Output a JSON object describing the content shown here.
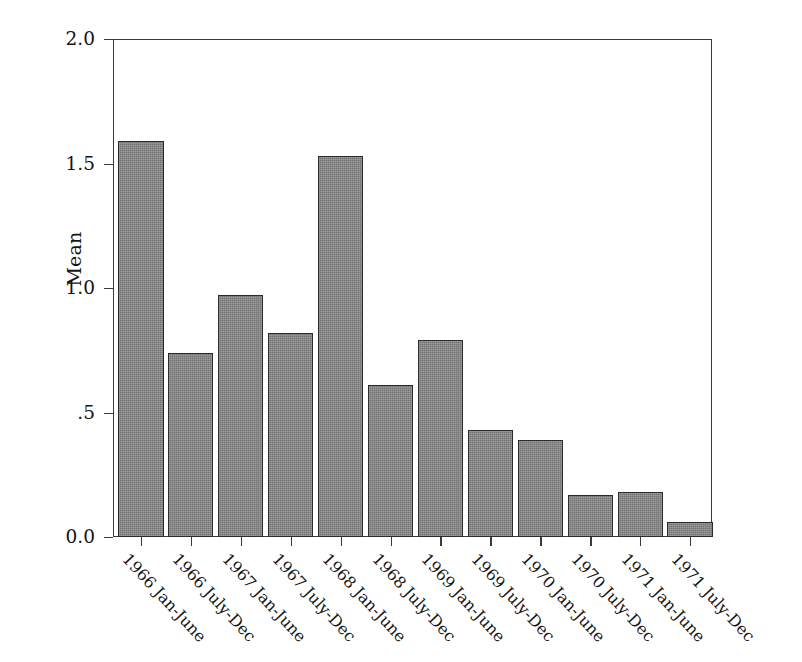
{
  "chart_data": {
    "type": "bar",
    "title": "",
    "subtitle": "",
    "xlabel": "",
    "ylabel": "Mean",
    "ylim": [
      0.0,
      2.0
    ],
    "yticks": [
      0.0,
      0.5,
      1.0,
      1.5,
      2.0
    ],
    "ytick_labels": [
      "0.0",
      ".5",
      "1.0",
      "1.5",
      "2.0"
    ],
    "grid": false,
    "legend": null,
    "legend_position": "none",
    "bar_color": "#858585",
    "bar_edge_color": "#2b2b2b",
    "axis_color": "#3a3a3a",
    "background_color": "#ffffff",
    "categories": [
      "1966 Jan-June",
      "1966 July-Dec",
      "1967 Jan-June",
      "1967 July-Dec",
      "1968 Jan-June",
      "1968 July-Dec",
      "1969 Jan-June",
      "1969 July-Dec",
      "1970 Jan-June",
      "1970 July-Dec",
      "1971 Jan-June",
      "1971 July-Dec"
    ],
    "values": [
      1.59,
      0.74,
      0.97,
      0.82,
      1.53,
      0.61,
      0.79,
      0.43,
      0.39,
      0.17,
      0.18,
      0.06
    ]
  }
}
